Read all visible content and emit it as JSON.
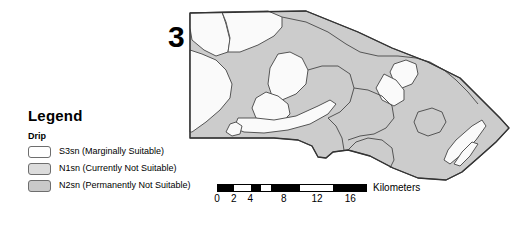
{
  "figure": {
    "name": "drip-irrigation-suitability-map",
    "index_label": "3"
  },
  "legend": {
    "title": "Legend",
    "group_label": "Drip",
    "items": [
      {
        "code": "S3sn",
        "label": "S3sn (Marginally Suitable)",
        "color": "#ffffff",
        "swatch": "s3sn"
      },
      {
        "code": "N1sn",
        "label": "N1sn (Currently Not Suitable)",
        "color": "#dcdcdc",
        "swatch": "n1sn"
      },
      {
        "code": "N2sn",
        "label": "N2sn (Permanently Not Suitable)",
        "color": "#c9c9c9",
        "swatch": "n2sn"
      }
    ]
  },
  "scalebar": {
    "units": "Kilometers",
    "min": 0,
    "max": 18,
    "tick_labels": [
      "0",
      "2",
      "4",
      "8",
      "12",
      "16"
    ],
    "tick_values": [
      0,
      2,
      4,
      8,
      12,
      16
    ],
    "segments": [
      {
        "from": 0,
        "to": 2,
        "fill": "black"
      },
      {
        "from": 2,
        "to": 4,
        "fill": "white"
      },
      {
        "from": 4,
        "to": 5.2,
        "fill": "black"
      },
      {
        "from": 5.2,
        "to": 6.4,
        "fill": "white"
      },
      {
        "from": 6.4,
        "to": 10,
        "fill": "black"
      },
      {
        "from": 10,
        "to": 14,
        "fill": "white"
      },
      {
        "from": 14,
        "to": 18,
        "fill": "black"
      }
    ]
  },
  "colors": {
    "polygon_fill": "#cccccc",
    "patch_fill": "#fafafa",
    "outline": "#555555",
    "border": "#333333",
    "text": "#000000"
  }
}
